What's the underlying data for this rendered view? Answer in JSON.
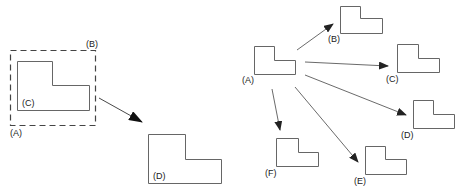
{
  "left_panel": {
    "labels": {
      "a": "(A)",
      "b": "(B)",
      "c": "(C)",
      "d": "(D)"
    },
    "description": "Selection box (dashed) around L-shaped object, moved to new position"
  },
  "right_panel": {
    "labels": {
      "a": "(A)",
      "b": "(B)",
      "c": "(C)",
      "d": "(D)",
      "e": "(E)",
      "f": "(F)"
    },
    "description": "Original L-shape copied to multiple destinations"
  },
  "colors": {
    "stroke": "#555555",
    "arrow": "#222222",
    "dash": "#444444"
  }
}
